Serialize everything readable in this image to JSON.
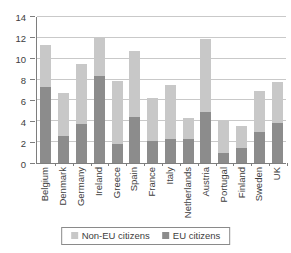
{
  "chart_data": {
    "type": "bar",
    "stacked": true,
    "title": "",
    "categories": [
      "Belgium",
      "Denmark",
      "Germany",
      "Ireland",
      "Greece",
      "Spain",
      "France",
      "Italy",
      "Netherlands",
      "Austria",
      "Portugal",
      "Finland",
      "Sweden",
      "UK"
    ],
    "series": [
      {
        "name": "EU citizens",
        "color": "#8c8c8c",
        "values": [
          7.2,
          2.6,
          3.7,
          8.3,
          1.8,
          4.4,
          2.1,
          2.3,
          2.3,
          4.9,
          1.0,
          1.4,
          3.0,
          3.8
        ]
      },
      {
        "name": "Non-EU citizens",
        "color": "#c8c8c8",
        "values": [
          4.0,
          4.1,
          5.7,
          3.6,
          6.0,
          6.3,
          4.1,
          5.1,
          2.0,
          6.9,
          3.0,
          2.1,
          3.9,
          3.9
        ]
      }
    ],
    "totals": [
      11.2,
      6.7,
      9.4,
      11.9,
      7.8,
      10.7,
      6.2,
      7.4,
      4.3,
      11.8,
      4.0,
      3.5,
      6.9,
      7.7
    ],
    "xlabel": "",
    "ylabel": "",
    "ylim": [
      0,
      14
    ],
    "yticks": [
      0,
      2,
      4,
      6,
      8,
      10,
      12,
      14
    ],
    "grid": "horizontal",
    "legend_position": "bottom"
  },
  "legend": {
    "items": [
      {
        "label": "Non-EU citizens",
        "color": "#c8c8c8"
      },
      {
        "label": "EU citizens",
        "color": "#8c8c8c"
      }
    ]
  },
  "colors": {
    "background": "#ffffff",
    "axis": "#7e7e7e",
    "gridline": "#c9c9c9",
    "text": "#3d3d3d",
    "legend_border": "#8a8a8a",
    "bar_eu": "#8c8c8c",
    "bar_non_eu": "#c8c8c8"
  }
}
